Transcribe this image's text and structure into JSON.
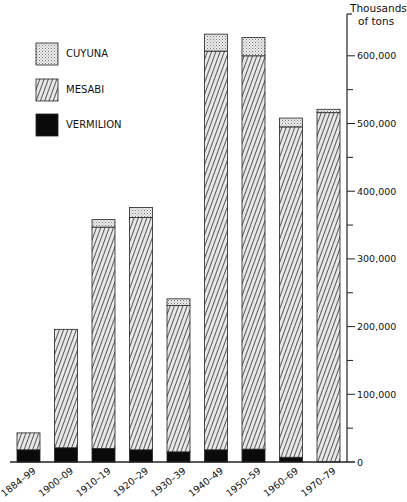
{
  "chart_data": {
    "type": "bar",
    "stacked": true,
    "title": "",
    "xlabel": "",
    "ylabel": "Thousands of tons",
    "ylabel_lines": [
      "Thousands",
      "of tons"
    ],
    "ylim": [
      0,
      650000
    ],
    "yticks": [
      0,
      100000,
      200000,
      300000,
      400000,
      500000,
      600000
    ],
    "ytick_labels": [
      "0",
      "100,000",
      "200,000",
      "300,000",
      "400,000",
      "500,000",
      "600,000"
    ],
    "minor_ticks": [
      50000,
      150000,
      250000,
      350000,
      450000,
      550000
    ],
    "grid": false,
    "axis_position": "right",
    "legend_position": "top-left",
    "categories": [
      "1884–99",
      "1900–09",
      "1910–19",
      "1920–29",
      "1930–39",
      "1940–49",
      "1950–59",
      "1960–69",
      "1970–79"
    ],
    "series": [
      {
        "name": "VERMILION",
        "pattern": "solid-black",
        "values": [
          18000,
          21000,
          20000,
          18000,
          15000,
          18000,
          19000,
          7000,
          0
        ]
      },
      {
        "name": "MESABI",
        "pattern": "diagonal-hatch",
        "values": [
          25000,
          175000,
          327000,
          343000,
          216000,
          589000,
          581000,
          488000,
          516000
        ]
      },
      {
        "name": "CUYUNA",
        "pattern": "stipple",
        "values": [
          0,
          0,
          11000,
          15000,
          10000,
          25000,
          27000,
          13000,
          5000
        ]
      }
    ]
  },
  "legend": [
    {
      "label": "CUYUNA",
      "pattern": "stipple"
    },
    {
      "label": "MESABI",
      "pattern": "diagonal-hatch"
    },
    {
      "label": "VERMILION",
      "pattern": "solid-black"
    }
  ]
}
